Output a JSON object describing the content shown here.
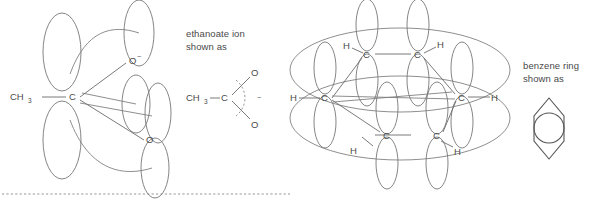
{
  "figure": {
    "name": "delocalisation-orbital-diagrams",
    "stroke_color": "#6e6e6e",
    "text_color": "#4a4a4a",
    "background": "#ffffff"
  },
  "ethanoate_orbital_diagram": {
    "name": "ethanoate-ion-p-orbital-diagram",
    "labels": {
      "methyl": "CH",
      "methyl_sub": "3",
      "carbon": "C",
      "oxygen_top": "O",
      "oxygen_top_charge": "−",
      "oxygen_bottom": "O"
    }
  },
  "ethanoate_caption": {
    "name": "ethanoate-caption",
    "line1": "ethanoate ion",
    "line2": "shown as"
  },
  "ethanoate_skeletal": {
    "name": "ethanoate-skeletal-formula",
    "labels": {
      "methyl": "CH",
      "methyl_sub": "3",
      "carbon": "C",
      "oxygen_top": "O",
      "oxygen_bottom": "O",
      "charge": "−"
    }
  },
  "benzene_orbital_diagram": {
    "name": "benzene-p-orbital-diagram",
    "labels": {
      "carbon": "C",
      "hydrogen": "H"
    },
    "carbons": [
      {
        "name": "carbon-top-left",
        "label": "C"
      },
      {
        "name": "carbon-top-right",
        "label": "C"
      },
      {
        "name": "carbon-left",
        "label": "C"
      },
      {
        "name": "carbon-right",
        "label": "C"
      },
      {
        "name": "carbon-bottom-left",
        "label": "C"
      },
      {
        "name": "carbon-bottom-right",
        "label": "C"
      }
    ],
    "hydrogens": [
      {
        "name": "hydrogen-top-left",
        "label": "H"
      },
      {
        "name": "hydrogen-top-right",
        "label": "H"
      },
      {
        "name": "hydrogen-left",
        "label": "H"
      },
      {
        "name": "hydrogen-right",
        "label": "H"
      },
      {
        "name": "hydrogen-bottom-left",
        "label": "H"
      },
      {
        "name": "hydrogen-bottom-right",
        "label": "H"
      }
    ]
  },
  "benzene_caption": {
    "name": "benzene-caption",
    "line1": "benzene ring",
    "line2": "shown as"
  },
  "benzene_symbol": {
    "name": "benzene-ring-symbol"
  }
}
